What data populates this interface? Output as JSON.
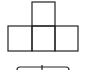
{
  "diagram": {
    "stroke_color": "#222222",
    "background": "#ffffff",
    "squares": [
      {
        "name": "top",
        "x": 32,
        "y": 2,
        "w": 23,
        "h": 24
      },
      {
        "name": "bottom-left",
        "x": 8,
        "y": 26,
        "w": 24,
        "h": 25
      },
      {
        "name": "bottom-middle",
        "x": 32,
        "y": 26,
        "w": 23,
        "h": 25
      },
      {
        "name": "bottom-right",
        "x": 55,
        "y": 26,
        "w": 23,
        "h": 25
      }
    ],
    "bracket": {
      "x1": 17,
      "x2": 69,
      "y": 67,
      "center_tick_x": 42
    }
  }
}
